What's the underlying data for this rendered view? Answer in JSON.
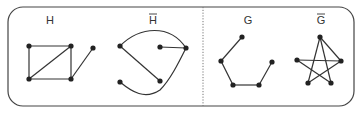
{
  "figure": {
    "frame": {
      "x": 8,
      "y": 7,
      "width": 346,
      "height": 99,
      "radius": 15
    },
    "divider": {
      "x": 203,
      "y1": 7,
      "y2": 106
    },
    "graphs": [
      {
        "name": "H",
        "label": "H",
        "overline": false,
        "label_pos": [
          50,
          24
        ],
        "nodes": [
          [
            29,
            46
          ],
          [
            71,
            46
          ],
          [
            93,
            48
          ],
          [
            29,
            79
          ],
          [
            71,
            79
          ]
        ],
        "edges": [
          {
            "path": "M29,46 L71,46"
          },
          {
            "path": "M29,46 L29,79"
          },
          {
            "path": "M71,46 L29,79"
          },
          {
            "path": "M71,46 L71,79"
          },
          {
            "path": "M29,79 L71,79"
          },
          {
            "path": "M71,79 L93,48"
          }
        ]
      },
      {
        "name": "H-complement",
        "label": "H",
        "overline": true,
        "label_pos": [
          153,
          24
        ],
        "nodes": [
          [
            120,
            46
          ],
          [
            160,
            47
          ],
          [
            186,
            48
          ],
          [
            120,
            82
          ],
          [
            160,
            81
          ]
        ],
        "edges": [
          {
            "path": "M120,46 C140,26 170,24 186,48"
          },
          {
            "path": "M160,47 L186,48"
          },
          {
            "path": "M120,46 L160,81"
          },
          {
            "path": "M120,82 C132,92 145,100 160,90 C170,80 178,64 186,48"
          }
        ]
      },
      {
        "name": "G",
        "label": "G",
        "overline": false,
        "label_pos": [
          248,
          24
        ],
        "nodes": [
          [
            242,
            37
          ],
          [
            221,
            61
          ],
          [
            233,
            85
          ],
          [
            259,
            85
          ],
          [
            272,
            62
          ]
        ],
        "edges": [
          {
            "path": "M242,37 L221,61"
          },
          {
            "path": "M221,61 L233,85"
          },
          {
            "path": "M233,85 L259,85"
          },
          {
            "path": "M259,85 L272,62"
          }
        ]
      },
      {
        "name": "G-complement",
        "label": "G",
        "overline": true,
        "label_pos": [
          321,
          24
        ],
        "nodes": [
          [
            320,
            37
          ],
          [
            297,
            60
          ],
          [
            341,
            61
          ],
          [
            308,
            83
          ],
          [
            331,
            83
          ]
        ],
        "edges": [
          {
            "path": "M320,37 L308,83"
          },
          {
            "path": "M320,37 L331,83"
          },
          {
            "path": "M320,37 L341,61"
          },
          {
            "path": "M297,60 L341,61"
          },
          {
            "path": "M297,60 L331,83"
          },
          {
            "path": "M341,61 L308,83"
          }
        ]
      }
    ]
  }
}
